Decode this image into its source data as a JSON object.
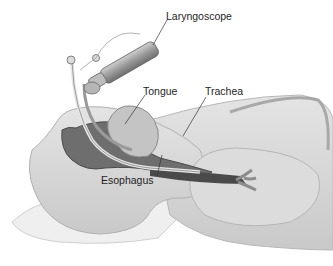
{
  "diagram": {
    "labels": [
      {
        "id": "laryngoscope",
        "text": "Laryngoscope"
      },
      {
        "id": "tongue",
        "text": "Tongue"
      },
      {
        "id": "trachea",
        "text": "Trachea"
      },
      {
        "id": "esophagus",
        "text": "Esophagus"
      }
    ],
    "colors": {
      "background": "#ffffff",
      "body": "#d9d9d9",
      "body_shade": "#bdbdbd",
      "cavity": "#6e6e6e",
      "instrument": "#a8a8a8",
      "pillow": "#eeeeee",
      "text": "#1e1e1e"
    }
  }
}
